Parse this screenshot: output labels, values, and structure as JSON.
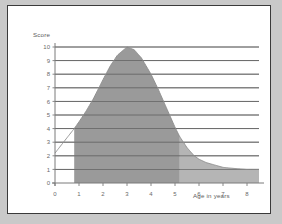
{
  "figure": {
    "background": "#ffffff",
    "page_background": "#c9c9c9",
    "border_color": "#3a3a3a"
  },
  "labels": {
    "y_axis_title": "Score",
    "x_axis_title": "Age in years"
  },
  "chart_data": {
    "type": "area",
    "title": "",
    "xlabel": "Age in years",
    "ylabel": "Score",
    "xlim": [
      0,
      8.5
    ],
    "ylim": [
      0,
      10
    ],
    "grid": true,
    "legend": null,
    "x_ticks": [
      0,
      1,
      2,
      3,
      4,
      5,
      6,
      7,
      8
    ],
    "y_ticks": [
      0,
      1,
      2,
      3,
      4,
      5,
      6,
      7,
      8,
      9,
      10
    ],
    "x_tick_labels": [
      "0",
      "1",
      "2",
      "3",
      "4",
      "5",
      "6",
      "7",
      "8"
    ],
    "y_tick_labels": [
      "0",
      "1",
      "2",
      "3",
      "4",
      "5",
      "6",
      "7",
      "8",
      "9",
      "10"
    ],
    "series": [
      {
        "name": "Score curve",
        "line_color": "#8c8c8c",
        "x": [
          0,
          0.4,
          0.8,
          1,
          1.3,
          1.6,
          2,
          2.3,
          2.6,
          3,
          3.3,
          3.6,
          4,
          4.3,
          4.6,
          5,
          5.2,
          5.5,
          5.8,
          6,
          6.3,
          6.6,
          7,
          7.4,
          8,
          8.5
        ],
        "y": [
          2.2,
          3.1,
          4.0,
          4.5,
          5.3,
          6.2,
          7.6,
          8.6,
          9.4,
          10.0,
          9.8,
          9.2,
          8.0,
          6.9,
          5.7,
          4.1,
          3.4,
          2.6,
          2.0,
          1.75,
          1.5,
          1.35,
          1.15,
          1.08,
          1.0,
          1.0
        ]
      }
    ],
    "shaded_regions": [
      {
        "name": "primary-shaded-band",
        "x_start": 0.8,
        "x_end": 5.2,
        "fill_color": "#9a9a9a",
        "fill_to": 0
      },
      {
        "name": "secondary-shaded-band",
        "x_start": 5.2,
        "x_end": 8.5,
        "fill_color": "#b5b5b5",
        "fill_to": 0
      }
    ],
    "annotations": []
  }
}
